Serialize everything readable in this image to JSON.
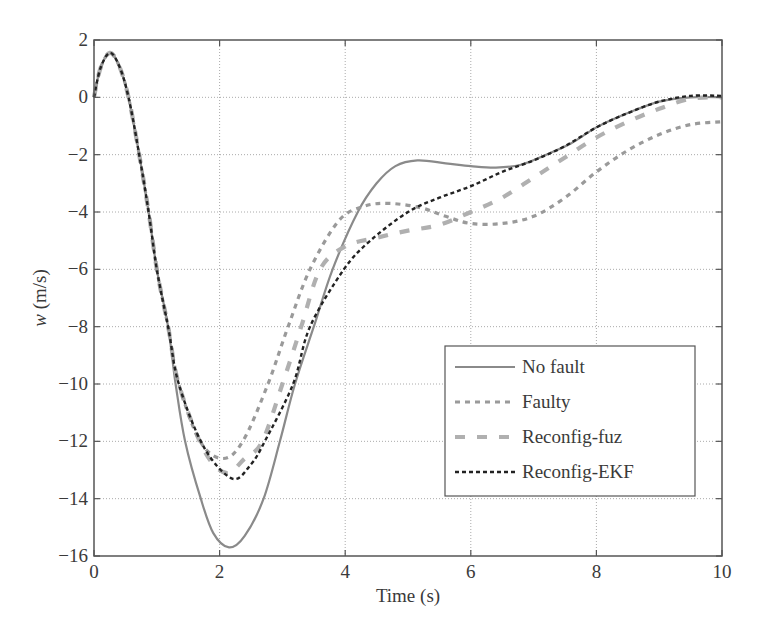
{
  "chart_data": {
    "type": "line",
    "title": "",
    "xlabel": "Time (s)",
    "ylabel": "w (m/s)",
    "ylabel_italic_part": "w",
    "ylabel_rest": " (m/s)",
    "xlim": [
      0,
      10
    ],
    "ylim": [
      -16,
      2
    ],
    "xticks": [
      0,
      2,
      4,
      6,
      8,
      10
    ],
    "yticks": [
      2,
      0,
      -2,
      -4,
      -6,
      -8,
      -10,
      -12,
      -14,
      -16
    ],
    "xtick_labels": [
      "0",
      "2",
      "4",
      "6",
      "8",
      "10"
    ],
    "ytick_labels": [
      "2",
      "0",
      "−2",
      "−4",
      "−6",
      "−8",
      "−10",
      "−12",
      "−14",
      "−16"
    ],
    "grid": true,
    "legend_position": "lower right",
    "series": [
      {
        "name": "No fault",
        "style": "solid",
        "color": "#8a8a8a",
        "x": [
          0,
          0.1,
          0.25,
          0.4,
          0.55,
          0.72,
          0.87,
          1.0,
          1.18,
          1.3,
          1.45,
          1.7,
          1.9,
          2.15,
          2.4,
          2.7,
          2.96,
          3.2,
          3.5,
          3.8,
          4.2,
          4.5,
          4.8,
          5.15,
          5.6,
          6.0,
          6.4,
          6.8,
          7.2,
          7.6,
          8.0,
          8.5,
          9.0,
          9.5,
          10
        ],
        "y": [
          0,
          1.0,
          1.55,
          1.1,
          0,
          -2,
          -4,
          -6,
          -8,
          -10,
          -12,
          -14,
          -15.2,
          -15.7,
          -15.3,
          -14,
          -12,
          -10,
          -8,
          -6,
          -4,
          -3,
          -2.4,
          -2.2,
          -2.3,
          -2.4,
          -2.45,
          -2.35,
          -2.0,
          -1.6,
          -1.05,
          -0.55,
          -0.15,
          0.0,
          0.0
        ]
      },
      {
        "name": "Faulty",
        "style": "short-dash",
        "color": "#9a9a9a",
        "x": [
          0,
          0.1,
          0.25,
          0.4,
          0.55,
          0.72,
          0.87,
          1.0,
          1.18,
          1.35,
          1.69,
          2.05,
          2.37,
          2.77,
          3.09,
          3.44,
          3.9,
          4.3,
          4.7,
          5.2,
          5.6,
          6.0,
          6.5,
          7.0,
          7.5,
          8.0,
          8.5,
          9.0,
          9.5,
          10
        ],
        "y": [
          0,
          1.0,
          1.55,
          1.1,
          0,
          -2,
          -4,
          -6,
          -8,
          -10,
          -12,
          -12.6,
          -12,
          -10,
          -8,
          -6,
          -4.3,
          -3.8,
          -3.7,
          -3.85,
          -4.15,
          -4.4,
          -4.4,
          -4.15,
          -3.5,
          -2.6,
          -1.85,
          -1.3,
          -0.95,
          -0.85
        ]
      },
      {
        "name": "Reconfig-fuz",
        "style": "long-dash",
        "color": "#b0b0b0",
        "x": [
          0,
          0.1,
          0.25,
          0.4,
          0.55,
          0.72,
          0.87,
          1.0,
          1.18,
          1.35,
          1.75,
          2.1,
          2.4,
          2.68,
          3.0,
          3.3,
          3.6,
          4.0,
          4.5,
          5.0,
          5.5,
          6.0,
          6.5,
          7.0,
          7.5,
          8.0,
          8.5,
          9.0,
          9.5,
          10
        ],
        "y": [
          0,
          1.0,
          1.55,
          1.1,
          0,
          -2,
          -4,
          -6,
          -8,
          -10,
          -12.3,
          -13.1,
          -12.6,
          -12,
          -10,
          -8,
          -6,
          -5.2,
          -4.9,
          -4.65,
          -4.45,
          -4.0,
          -3.5,
          -2.8,
          -2.1,
          -1.4,
          -0.85,
          -0.4,
          -0.05,
          0.0
        ]
      },
      {
        "name": "Reconfig-EKF",
        "style": "dotted",
        "color": "#222222",
        "x": [
          0,
          0.1,
          0.25,
          0.4,
          0.55,
          0.72,
          0.87,
          1.0,
          1.18,
          1.35,
          1.75,
          2.2,
          2.5,
          2.72,
          3.17,
          3.44,
          3.98,
          4.4,
          5.0,
          5.5,
          6.0,
          6.5,
          7.0,
          7.5,
          8.0,
          8.5,
          9.0,
          9.5,
          10
        ],
        "y": [
          0,
          1.0,
          1.55,
          1.1,
          0,
          -2,
          -4,
          -6,
          -8,
          -10,
          -12.2,
          -13.3,
          -12.8,
          -12,
          -10,
          -8,
          -6,
          -5.0,
          -4.0,
          -3.5,
          -3.1,
          -2.6,
          -2.2,
          -1.7,
          -1.05,
          -0.55,
          -0.15,
          0.05,
          0.05
        ]
      }
    ]
  }
}
